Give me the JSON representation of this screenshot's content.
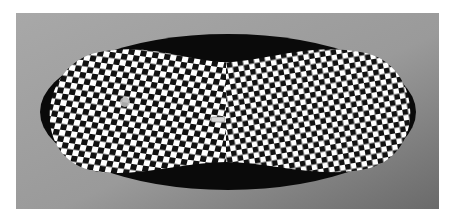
{
  "image": {
    "subject": "checkerboard-oval-artwork",
    "colors": {
      "page_background": "#ffffff",
      "frame_light": "#a6a6a6",
      "frame_dark": "#6e6e6e",
      "ellipse_shadow": "#0a0a0a",
      "check_dark": "#111111",
      "check_light": "#ffffff"
    }
  }
}
